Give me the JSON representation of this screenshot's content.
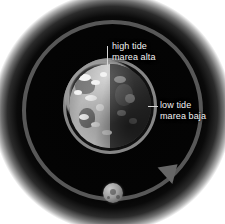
{
  "diagram": {
    "background_color": "#ffffff",
    "disc_color": "#030303",
    "orbit_color": "#575757",
    "label_color": "#f2f2f2"
  },
  "labels": {
    "high_tide": {
      "line1": "high tide",
      "line2": "marea alta"
    },
    "low_tide": {
      "line1": "low tide",
      "line2": "marea baja"
    }
  },
  "objects": {
    "earth": {
      "name": "Earth"
    },
    "moon": {
      "name": "Moon"
    },
    "orbit": {
      "name": "Moon orbit path"
    },
    "arrow": {
      "name": "Orbit direction arrow"
    },
    "bulge": {
      "name": "Tidal bulge ring"
    }
  }
}
